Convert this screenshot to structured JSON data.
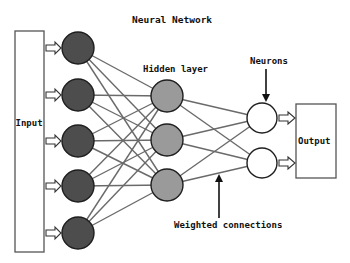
{
  "title": "Neural Network",
  "labels": {
    "input": "Input",
    "output": "Output",
    "hidden_layer": "Hidden layer",
    "neurons": "Neurons",
    "weighted_connections": "Weighted connections"
  },
  "colors": {
    "input_node_fill": "#4d4d4d",
    "hidden_node_fill": "#9a9a9a",
    "output_node_fill": "#ffffff",
    "node_stroke": "#1e1e1e",
    "connection": "#6a6a6a",
    "box_stroke": "#555555",
    "background": "#ffffff"
  },
  "layers": {
    "input_nodes": 5,
    "hidden_nodes": 3,
    "output_nodes": 2
  }
}
